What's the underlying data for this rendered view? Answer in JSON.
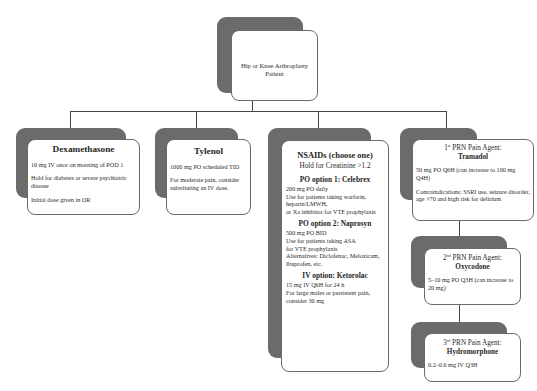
{
  "root": {
    "title": "Hip or Knee Arthroplasty Patient"
  },
  "dexamethasone": {
    "title": "Dexamethasone",
    "lines": [
      "10 mg IV once on morning of POD 1",
      "Hold for diabetes or severe psychiatric disease",
      "Initial dose given in OR"
    ]
  },
  "tylenol": {
    "title": "Tylenol",
    "lines": [
      "1000 mg PO scheduled TID",
      "For moderate pain, consider substituting an IV dose."
    ]
  },
  "nsaids": {
    "title": "NSAIDs (choose one)",
    "subtitle": "Hold for Creatinine >1.2",
    "options": [
      {
        "heading": "PO option 1: Celebrex",
        "lines": [
          "200 mg PO daily",
          "Use for patients taking warfarin,",
          "heparin/LMWH,",
          "or Xa inhibitor for VTE prophylaxis"
        ]
      },
      {
        "heading": "PO option 2: Naprosyn",
        "lines": [
          "500 mg PO BID",
          "Use for patients taking ASA",
          "for VTE prophylaxis",
          "Alternatives: Diclofenac, Meloxicam,",
          "Ibuprofen, etc."
        ]
      },
      {
        "heading": "IV option: Ketorolac",
        "lines": [
          "15 mg IV Q6H for 24 h",
          "For large males or persistent pain,",
          "consider 30 mg"
        ]
      }
    ]
  },
  "prn1": {
    "ordinal_num": "1",
    "ordinal_sup": "st",
    "label": " PRN Pain Agent:",
    "drug": "Tramadol",
    "lines": [
      "50 mg PO Q6H (can increase to 100 mg Q4H)",
      "Contraindications: SSRI use, seizure disorder, age >70 and high risk for delirium"
    ]
  },
  "prn2": {
    "ordinal_num": "2",
    "ordinal_sup": "nd",
    "label": " PRN Pain Agent:",
    "drug": "Oxycodone",
    "lines": [
      "5–10 mg PO Q3H (can increase to 20 mg)"
    ]
  },
  "prn3": {
    "ordinal_num": "3",
    "ordinal_sup": "rd",
    "label": " PRN Pain Agent:",
    "drug": "Hydromorphone",
    "lines": [
      "0.2–0.6 mg IV Q3H"
    ]
  },
  "colors": {
    "shadow": "#6b6b6b",
    "border": "#6a6a6a",
    "connector": "#444444",
    "background": "#ffffff"
  }
}
